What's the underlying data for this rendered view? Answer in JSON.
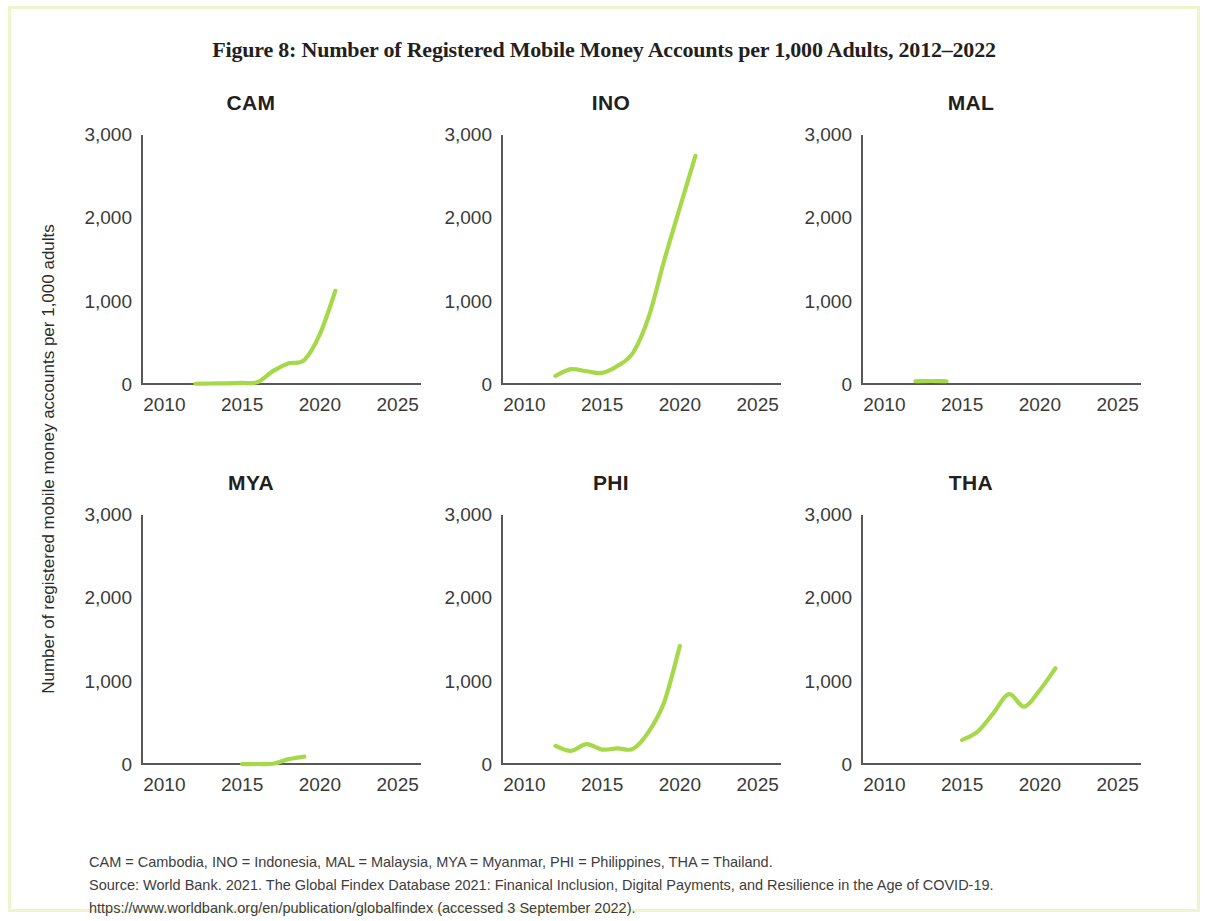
{
  "figure": {
    "title": "Figure 8: Number of Registered Mobile Money Accounts per 1,000 Adults, 2012–2022",
    "y_axis_label": "Number of registered mobile money accounts per 1,000 adults",
    "line_color": "#a5d94a",
    "axis_color": "#58585a",
    "frame_color": "#eef5cd",
    "notes": {
      "abbreviations": "CAM = Cambodia, INO = Indonesia, MAL = Malaysia, MYA = Myanmar, PHI = Philippines, THA = Thailand.",
      "source": "Source: World Bank. 2021. The Global Findex Database 2021: Finanical Inclusion, Digital Payments, and Resilience in the Age of COVID-19.",
      "url": "https://www.worldbank.org/en/publication/globalfindex (accessed 3 September 2022)."
    }
  },
  "chart_data": [
    {
      "type": "line",
      "title": "CAM",
      "xlabel": "",
      "ylabel": "Number of registered mobile money accounts per 1,000 adults",
      "xlim": [
        2008.5,
        2026.5
      ],
      "ylim": [
        0,
        3000
      ],
      "xticks": [
        "2010",
        "2015",
        "2020",
        "2025"
      ],
      "xtick_values": [
        2010,
        2015,
        2020,
        2025
      ],
      "yticks": [
        "0",
        "1,000",
        "2,000",
        "3,000"
      ],
      "ytick_values": [
        0,
        1000,
        2000,
        3000
      ],
      "grid": false,
      "legend": "none",
      "x": [
        2012,
        2013,
        2014,
        2015,
        2016,
        2017,
        2018,
        2019,
        2020,
        2021
      ],
      "values": [
        15,
        18,
        20,
        25,
        35,
        170,
        260,
        300,
        610,
        1130
      ]
    },
    {
      "type": "line",
      "title": "INO",
      "xlabel": "",
      "ylabel": "",
      "xlim": [
        2008.5,
        2026.5
      ],
      "ylim": [
        0,
        3000
      ],
      "xticks": [
        "2010",
        "2015",
        "2020",
        "2025"
      ],
      "xtick_values": [
        2010,
        2015,
        2020,
        2025
      ],
      "yticks": [
        "0",
        "1,000",
        "2,000",
        "3,000"
      ],
      "ytick_values": [
        0,
        1000,
        2000,
        3000
      ],
      "grid": false,
      "legend": "none",
      "x": [
        2012,
        2013,
        2014,
        2015,
        2016,
        2017,
        2018,
        2019,
        2020,
        2021
      ],
      "values": [
        110,
        190,
        165,
        145,
        230,
        390,
        820,
        1500,
        2130,
        2750
      ]
    },
    {
      "type": "line",
      "title": "MAL",
      "xlabel": "",
      "ylabel": "",
      "xlim": [
        2008.5,
        2026.5
      ],
      "ylim": [
        0,
        3000
      ],
      "xticks": [
        "2010",
        "2015",
        "2020",
        "2025"
      ],
      "xtick_values": [
        2010,
        2015,
        2020,
        2025
      ],
      "yticks": [
        "0",
        "1,000",
        "2,000",
        "3,000"
      ],
      "ytick_values": [
        0,
        1000,
        2000,
        3000
      ],
      "grid": false,
      "legend": "none",
      "x": [
        2012,
        2013,
        2014
      ],
      "values": [
        45,
        48,
        45
      ]
    },
    {
      "type": "line",
      "title": "MYA",
      "xlabel": "",
      "ylabel": "",
      "xlim": [
        2008.5,
        2026.5
      ],
      "ylim": [
        0,
        3000
      ],
      "xticks": [
        "2010",
        "2015",
        "2020",
        "2025"
      ],
      "xtick_values": [
        2010,
        2015,
        2020,
        2025
      ],
      "yticks": [
        "0",
        "1,000",
        "2,000",
        "3,000"
      ],
      "ytick_values": [
        0,
        1000,
        2000,
        3000
      ],
      "grid": false,
      "legend": "none",
      "x": [
        2015,
        2016,
        2017,
        2018,
        2019
      ],
      "values": [
        10,
        12,
        15,
        70,
        100
      ]
    },
    {
      "type": "line",
      "title": "PHI",
      "xlabel": "",
      "ylabel": "",
      "xlim": [
        2008.5,
        2026.5
      ],
      "ylim": [
        0,
        3000
      ],
      "xticks": [
        "2010",
        "2015",
        "2020",
        "2025"
      ],
      "xtick_values": [
        2010,
        2015,
        2020,
        2025
      ],
      "yticks": [
        "0",
        "1,000",
        "2,000",
        "3,000"
      ],
      "ytick_values": [
        0,
        1000,
        2000,
        3000
      ],
      "grid": false,
      "legend": "none",
      "x": [
        2012,
        2013,
        2014,
        2015,
        2016,
        2017,
        2018,
        2019,
        2020
      ],
      "values": [
        230,
        170,
        250,
        185,
        200,
        195,
        400,
        760,
        1430
      ]
    },
    {
      "type": "line",
      "title": "THA",
      "xlabel": "",
      "ylabel": "",
      "xlim": [
        2008.5,
        2026.5
      ],
      "ylim": [
        0,
        3000
      ],
      "xticks": [
        "2010",
        "2015",
        "2020",
        "2025"
      ],
      "xtick_values": [
        2010,
        2015,
        2020,
        2025
      ],
      "yticks": [
        "0",
        "1,000",
        "2,000",
        "3,000"
      ],
      "ytick_values": [
        0,
        1000,
        2000,
        3000
      ],
      "grid": false,
      "legend": "none",
      "x": [
        2015,
        2016,
        2017,
        2018,
        2019,
        2020,
        2021
      ],
      "values": [
        300,
        400,
        620,
        850,
        700,
        900,
        1160
      ]
    }
  ]
}
